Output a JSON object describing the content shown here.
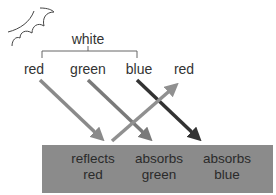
{
  "diagram": {
    "source_label": "white",
    "components": [
      {
        "label": "red",
        "color": "#888888"
      },
      {
        "label": "green",
        "color": "#7a7a7a"
      },
      {
        "label": "blue",
        "color": "#333333"
      }
    ],
    "reflected_label": "red",
    "surface": {
      "color": "#8b8b8b",
      "items": [
        {
          "line1": "reflects",
          "line2": "red"
        },
        {
          "line1": "absorbs",
          "line2": "green"
        },
        {
          "line1": "absorbs",
          "line2": "blue"
        }
      ]
    },
    "reflected_arrow_color": "#8e8e8e"
  }
}
